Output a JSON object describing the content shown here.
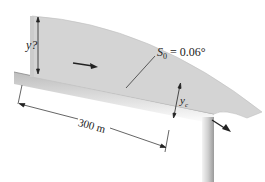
{
  "diagram": {
    "type": "open-channel flow over a sloped channel ending in a free overfall",
    "labels": {
      "upstream_depth": "y?",
      "slope_symbol": "S",
      "slope_subscript": "0",
      "slope_value": " = 0.06°",
      "critical_depth_symbol": "y",
      "critical_depth_subscript": "c",
      "length": "300 m"
    },
    "colors": {
      "water": "#d4d4d4",
      "water_edge": "#b8b8b8",
      "channel": "#e2e2e2",
      "channel_shadow": "#a8a8a8",
      "line": "#333333"
    }
  }
}
